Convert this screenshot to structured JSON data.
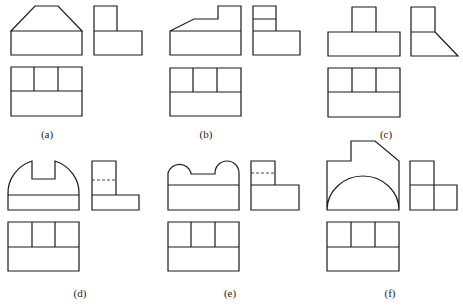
{
  "figure": {
    "line_color": "#1a1a1a",
    "background": "#ffffff",
    "panels": [
      {
        "id": "a",
        "label": "(a)"
      },
      {
        "id": "b",
        "label": "(b)"
      },
      {
        "id": "c",
        "label": "(c)"
      },
      {
        "id": "d",
        "label": "(d)"
      },
      {
        "id": "e",
        "label": "(e)"
      },
      {
        "id": "f",
        "label": "(f)"
      }
    ]
  }
}
